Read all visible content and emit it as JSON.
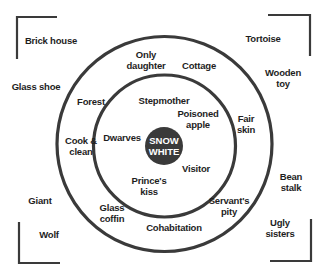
{
  "diagram": {
    "center": {
      "label": "SNOW\nWHITE",
      "color": "#3a3a3a"
    },
    "inner_ring": [
      {
        "label": "Stepmother",
        "x": 164,
        "y": 100
      },
      {
        "label": "Poisoned\napple",
        "x": 198,
        "y": 118
      },
      {
        "label": "Dwarves",
        "x": 123,
        "y": 136
      },
      {
        "label": "Visitor",
        "x": 196,
        "y": 168
      },
      {
        "label": "Prince's\nkiss",
        "x": 149,
        "y": 185
      }
    ],
    "outer_ring": [
      {
        "label": "Only\ndaughter",
        "x": 146,
        "y": 61
      },
      {
        "label": "Cottage",
        "x": 199,
        "y": 65
      },
      {
        "label": "Forest",
        "x": 91,
        "y": 101
      },
      {
        "label": "Fair\nskin",
        "x": 245,
        "y": 123
      },
      {
        "label": "Cook &\nclean",
        "x": 81,
        "y": 146
      },
      {
        "label": "Glass\ncoffin",
        "x": 112,
        "y": 213
      },
      {
        "label": "Servant's\npity",
        "x": 229,
        "y": 205
      },
      {
        "label": "Cohabitation",
        "x": 173,
        "y": 227
      }
    ],
    "outside": [
      {
        "label": "Brick house",
        "x": 51,
        "y": 40
      },
      {
        "label": "Tortoise",
        "x": 263,
        "y": 38
      },
      {
        "label": "Glass shoe",
        "x": 36,
        "y": 86
      },
      {
        "label": "Wooden toy",
        "x": 283,
        "y": 78
      },
      {
        "label": "Bean stalk",
        "x": 291,
        "y": 182
      },
      {
        "label": "Giant",
        "x": 40,
        "y": 200
      },
      {
        "label": "Wolf",
        "x": 49,
        "y": 234
      },
      {
        "label": "Ugly sisters",
        "x": 280,
        "y": 228
      }
    ],
    "colors": {
      "ring": "#3a3a3a",
      "text": "#1e1e1e",
      "background": "#ffffff"
    }
  }
}
